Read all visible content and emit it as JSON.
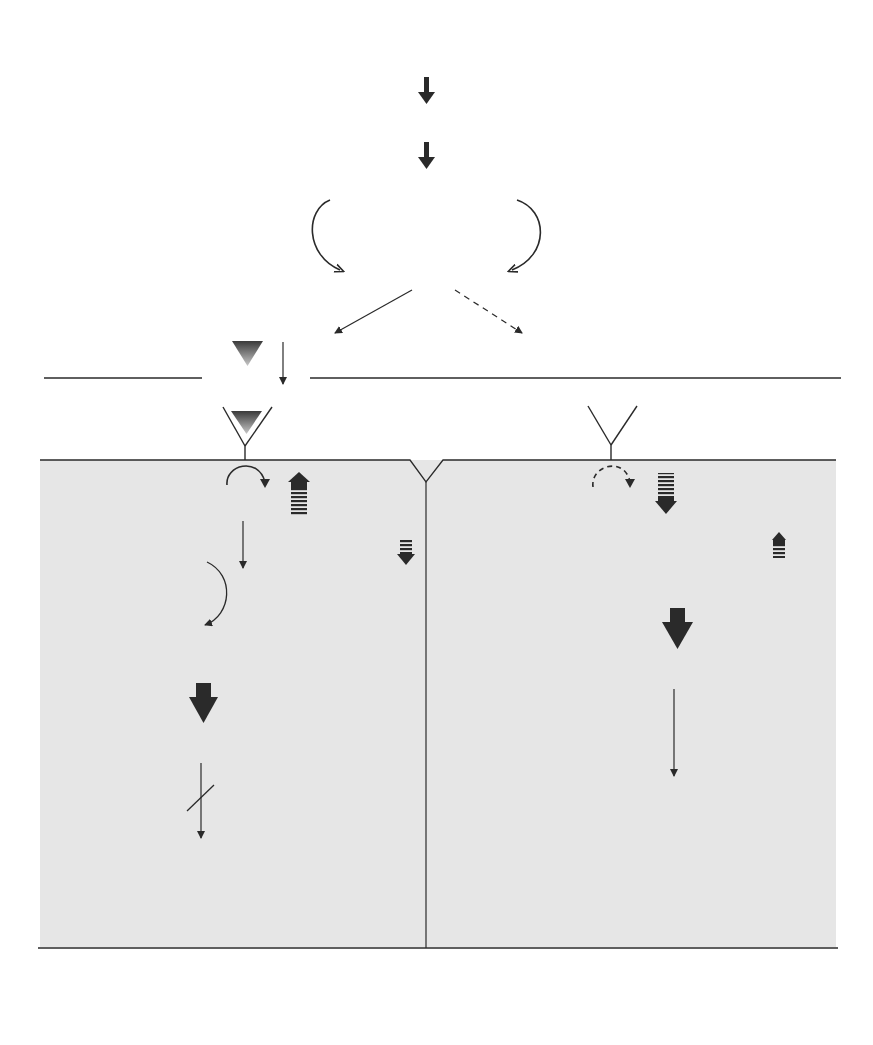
{
  "headers": {
    "summer": {
      "title": "SUMMER",
      "subtitle": "(Long daylength)"
    },
    "winter": {
      "title": "WINTER",
      "subtitle": "(Short daylength)"
    }
  },
  "top_chain": {
    "photoperiod": "Photoperiod",
    "cns": "CNS",
    "hypothalamus": "Hypothalamus",
    "ghrh": "GHRH",
    "somatostatin": "Somatostatin",
    "pituitary": "Pituitary",
    "gh": "GH",
    "no_gh": "No GH"
  },
  "liver": {
    "label": "Liver",
    "summer": {
      "receptor": "GH receptor",
      "igf1": "IGF-1",
      "active_cebp": "Active C/EBP",
      "and_or_aep": "And/or AEP",
      "dephosphorylation": "Dephosphorylation",
      "inactive_cebp": "Inactive C/EBP",
      "alpha": "α",
      "afp_gene": "AFP gene",
      "transcription_inhibited_1": "Transcription",
      "transcription_inhibited_2": "inhibited",
      "no_mrna": "No mRNA"
    },
    "winter": {
      "receptor": "GH receptor",
      "igf1": "IGF-1",
      "active_cebp": "Active C/EBP",
      "alpha": "α",
      "and": "And",
      "aep": "AEP",
      "afp_gene": "AFP gene",
      "active_transcription_1": "Active",
      "active_transcription_2": "transcription",
      "mrna": "mRNA",
      "low_temp": "Low Temp",
      "high_temp": "High Temp",
      "preproafp": "PreproAFP",
      "proafp": "ProAFP",
      "degradation": "Degradation"
    }
  },
  "blood": {
    "proafp": "ProAFP",
    "mature_afp": "Mature AFP in Blood"
  },
  "colors": {
    "panel": "#e6e6e6",
    "ink": "#2a2a2a",
    "gh_triangle_top": "#3a3a3a",
    "gh_triangle_bottom": "#bdbdbd"
  }
}
